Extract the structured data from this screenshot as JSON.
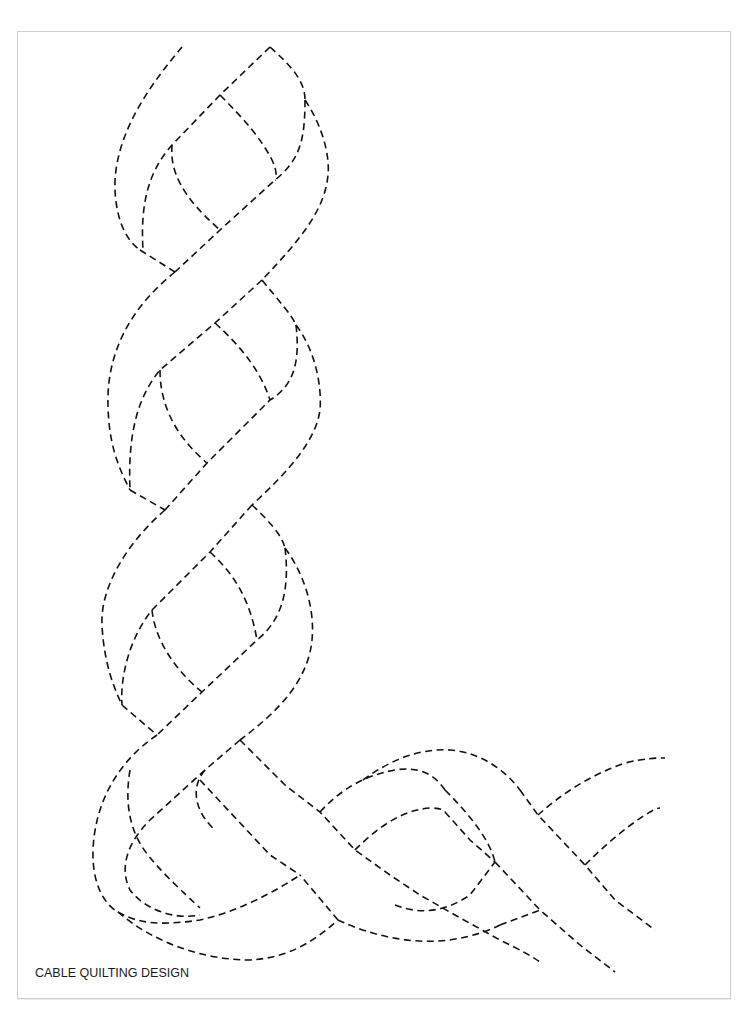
{
  "page": {
    "caption": "CABLE QUILTING DESIGN"
  },
  "design": {
    "name": "cable-quilting-corner",
    "stroke_color": "#111111",
    "stroke_style": "dashed",
    "frame_border_color": "#cfcfcf"
  }
}
